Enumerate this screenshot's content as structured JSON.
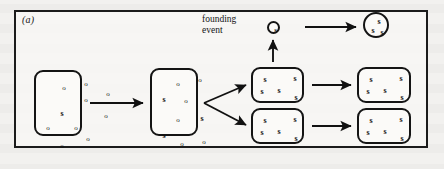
{
  "figure": {
    "panel_label": "(a)",
    "caption_founding": "founding\nevent",
    "caption_founding_line1": "founding",
    "caption_founding_line2": "event",
    "frame_color": "#1b1b1b",
    "ink_color": "#111111",
    "page_color": "#f2f1ef"
  },
  "legend": {
    "allele_common": "o",
    "allele_rare": "s"
  },
  "populations": [
    {
      "id": "source-population",
      "name": "source-population-box",
      "shape": "rounded-rect",
      "label": "large source population",
      "x": 34,
      "y": 70,
      "w": 48,
      "h": 66,
      "symbols": [
        {
          "t": "o",
          "x": 28,
          "y": 16
        },
        {
          "t": "o",
          "x": 50,
          "y": 12
        },
        {
          "t": "o",
          "x": 50,
          "y": 28
        },
        {
          "t": "o",
          "x": 72,
          "y": 22
        },
        {
          "t": "s",
          "x": 26,
          "y": 42
        },
        {
          "t": "o",
          "x": 70,
          "y": 44
        },
        {
          "t": "o",
          "x": 12,
          "y": 56
        },
        {
          "t": "o",
          "x": 40,
          "y": 56
        },
        {
          "t": "o",
          "x": 52,
          "y": 67
        },
        {
          "t": "o",
          "x": 26,
          "y": 74
        }
      ]
    },
    {
      "id": "intermediate-population",
      "name": "intermediate-population-box",
      "shape": "rounded-rect",
      "label": "population after drift",
      "x": 150,
      "y": 68,
      "w": 48,
      "h": 68,
      "symbols": [
        {
          "t": "o",
          "x": 26,
          "y": 14
        },
        {
          "t": "o",
          "x": 48,
          "y": 10
        },
        {
          "t": "s",
          "x": 12,
          "y": 30
        },
        {
          "t": "o",
          "x": 34,
          "y": 31
        },
        {
          "t": "o",
          "x": 26,
          "y": 50
        },
        {
          "t": "s",
          "x": 50,
          "y": 49
        },
        {
          "t": "s",
          "x": 12,
          "y": 66
        },
        {
          "t": "o",
          "x": 30,
          "y": 74
        },
        {
          "t": "o",
          "x": 52,
          "y": 72
        }
      ]
    },
    {
      "id": "descendant-upper",
      "name": "descendant-population-upper-box",
      "shape": "rounded-rect",
      "label": "descendant population (upper branch)",
      "x": 251,
      "y": 67,
      "w": 53,
      "h": 36,
      "symbols": [
        {
          "t": "s",
          "x": 12,
          "y": 11
        },
        {
          "t": "s",
          "x": 42,
          "y": 10
        },
        {
          "t": "s",
          "x": 9,
          "y": 23
        },
        {
          "t": "s",
          "x": 26,
          "y": 22
        },
        {
          "t": "s",
          "x": 43,
          "y": 29
        }
      ]
    },
    {
      "id": "descendant-lower",
      "name": "descendant-population-lower-box",
      "shape": "rounded-rect",
      "label": "descendant population (lower branch)",
      "x": 251,
      "y": 108,
      "w": 53,
      "h": 36,
      "symbols": [
        {
          "t": "s",
          "x": 12,
          "y": 11
        },
        {
          "t": "s",
          "x": 42,
          "y": 10
        },
        {
          "t": "s",
          "x": 9,
          "y": 23
        },
        {
          "t": "s",
          "x": 26,
          "y": 22
        },
        {
          "t": "s",
          "x": 43,
          "y": 29
        }
      ]
    },
    {
      "id": "final-upper",
      "name": "final-population-upper-box",
      "shape": "rounded-rect",
      "label": "final population (upper branch)",
      "x": 357,
      "y": 67,
      "w": 54,
      "h": 36,
      "symbols": [
        {
          "t": "s",
          "x": 12,
          "y": 11
        },
        {
          "t": "s",
          "x": 42,
          "y": 10
        },
        {
          "t": "s",
          "x": 9,
          "y": 23
        },
        {
          "t": "s",
          "x": 26,
          "y": 22
        },
        {
          "t": "s",
          "x": 43,
          "y": 29
        }
      ]
    },
    {
      "id": "final-lower",
      "name": "final-population-lower-box",
      "shape": "rounded-rect",
      "label": "final population (lower branch)",
      "x": 357,
      "y": 108,
      "w": 54,
      "h": 36,
      "symbols": [
        {
          "t": "s",
          "x": 12,
          "y": 11
        },
        {
          "t": "s",
          "x": 42,
          "y": 10
        },
        {
          "t": "s",
          "x": 9,
          "y": 23
        },
        {
          "t": "s",
          "x": 26,
          "y": 22
        },
        {
          "t": "s",
          "x": 43,
          "y": 29
        }
      ]
    },
    {
      "id": "founder-circle",
      "name": "founder-individual-circle",
      "shape": "circle",
      "label": "founding individual",
      "x": 267,
      "y": 21,
      "w": 13,
      "h": 13,
      "symbols": [
        {
          "t": "s",
          "x": 6.5,
          "y": 6.5,
          "tiny": true
        }
      ]
    },
    {
      "id": "new-population-circle",
      "name": "new-population-circle",
      "shape": "circle",
      "label": "new founded population",
      "x": 363,
      "y": 12,
      "w": 26,
      "h": 26,
      "symbols": [
        {
          "t": "s",
          "x": 14,
          "y": 8
        },
        {
          "t": "s",
          "x": 8,
          "y": 17
        },
        {
          "t": "s",
          "x": 17,
          "y": 19
        }
      ]
    }
  ],
  "arrows": [
    {
      "id": "arrow-source-to-intermediate",
      "name": "arrow-source-to-intermediate",
      "x1": 90,
      "y1": 103,
      "x2": 143,
      "y2": 103
    },
    {
      "id": "arrow-fork-upper",
      "name": "arrow-fork-upper",
      "x1": 204,
      "y1": 103,
      "x2": 246,
      "y2": 85
    },
    {
      "id": "arrow-fork-lower",
      "name": "arrow-fork-lower",
      "x1": 204,
      "y1": 103,
      "x2": 246,
      "y2": 125
    },
    {
      "id": "arrow-upper-to-final",
      "name": "arrow-upper-to-final",
      "x1": 312,
      "y1": 85,
      "x2": 351,
      "y2": 85
    },
    {
      "id": "arrow-lower-to-final",
      "name": "arrow-lower-to-final",
      "x1": 312,
      "y1": 126,
      "x2": 351,
      "y2": 126
    },
    {
      "id": "arrow-founding-event",
      "name": "arrow-founding-event-vertical",
      "x1": 273,
      "y1": 62,
      "x2": 273,
      "y2": 40
    },
    {
      "id": "arrow-founder-to-new-population",
      "name": "arrow-founder-to-new-population",
      "x1": 305,
      "y1": 27,
      "x2": 356,
      "y2": 27
    }
  ]
}
